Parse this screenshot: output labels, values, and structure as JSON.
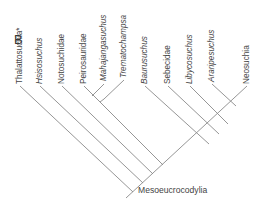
{
  "panel": {
    "label": "B"
  },
  "tree": {
    "root_label": "Mesoeucrocodylia",
    "taxa": [
      {
        "name": "Thalattosuchia*",
        "tip": [
          20,
          85
        ]
      },
      {
        "name": "Hsisosuchus",
        "tip": [
          40,
          85
        ]
      },
      {
        "name": "Notosuchidae",
        "tip": [
          62,
          85
        ]
      },
      {
        "name": "Peirosauridae",
        "tip": [
          84,
          85
        ]
      },
      {
        "name": "Mahajangasuchus",
        "tip": [
          104,
          82
        ]
      },
      {
        "name": "Trematochampsa",
        "tip": [
          124,
          79
        ]
      },
      {
        "name": "Baurusuchus",
        "tip": [
          145,
          85
        ]
      },
      {
        "name": "Sebecidae",
        "tip": [
          168,
          85
        ]
      },
      {
        "name": "Libycosuchus",
        "tip": [
          190,
          85
        ]
      },
      {
        "name": "Araripesuchus",
        "tip": [
          212,
          83
        ]
      },
      {
        "name": "Neosuchia",
        "tip": [
          247,
          85
        ]
      }
    ],
    "topology": "(Thalattosuchia*,(Hsisosuchus,(Notosuchidae,(((Peirosauridae,Mahajangasuchus),Trematochampsa),(Baurusuchus,(Sebecidae,(Libycosuchus,(Araripesuchus,Neosuchia))))))))"
  }
}
